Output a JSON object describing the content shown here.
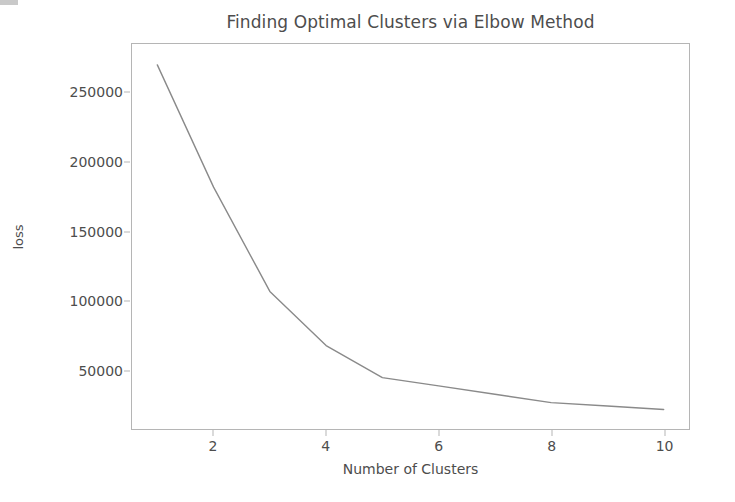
{
  "chart_data": {
    "type": "line",
    "title": "Finding Optimal Clusters via Elbow Method",
    "xlabel": "Number of Clusters",
    "ylabel": "loss",
    "x": [
      1,
      2,
      3,
      4,
      5,
      6,
      7,
      8,
      9,
      10
    ],
    "values": [
      270000,
      182000,
      107000,
      68000,
      45000,
      39000,
      33000,
      27000,
      24500,
      22000
    ],
    "series": [
      {
        "name": "loss",
        "values": [
          270000,
          182000,
          107000,
          68000,
          45000,
          39000,
          33000,
          27000,
          24500,
          22000
        ]
      }
    ],
    "xticks": [
      2,
      4,
      6,
      8,
      10
    ],
    "xtick_labels": [
      "2",
      "4",
      "6",
      "8",
      "10"
    ],
    "yticks": [
      50000,
      100000,
      150000,
      200000,
      250000
    ],
    "ytick_labels": [
      "50000",
      "100000",
      "150000",
      "200000",
      "250000"
    ],
    "xlim": [
      0.55,
      10.45
    ],
    "ylim": [
      8000,
      285000
    ],
    "grid": false,
    "legend": null,
    "line_color": "#8a8a8a",
    "axis_color": "#b5b5b5",
    "text_color": "#4d4d4d",
    "background_color": "#ffffff"
  }
}
